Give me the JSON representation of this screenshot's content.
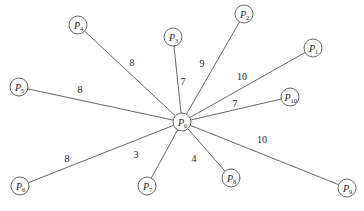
{
  "diagram": {
    "type": "star-graph",
    "center": {
      "id": "P0",
      "letter": "P",
      "sub": "0",
      "x": 182,
      "y": 122
    },
    "node_radius": 9,
    "colors": {
      "stroke": "#555555",
      "text": "#222222",
      "background": "#ffffff"
    },
    "nodes": [
      {
        "id": "P1",
        "letter": "P",
        "sub": "1",
        "x": 313,
        "y": 48,
        "weight": "10",
        "wx": 242,
        "wy": 80
      },
      {
        "id": "P2",
        "letter": "P",
        "sub": "2",
        "x": 244,
        "y": 14,
        "weight": "9",
        "wx": 202,
        "wy": 67
      },
      {
        "id": "P3",
        "letter": "P",
        "sub": "3",
        "x": 173,
        "y": 37,
        "weight": "7",
        "wx": 183,
        "wy": 85
      },
      {
        "id": "P4",
        "letter": "P",
        "sub": "4",
        "x": 78,
        "y": 25,
        "weight": "8",
        "wx": 132,
        "wy": 66
      },
      {
        "id": "P5",
        "letter": "P",
        "sub": "5",
        "x": 19,
        "y": 87,
        "weight": "8",
        "wx": 80,
        "wy": 93
      },
      {
        "id": "P6",
        "letter": "P",
        "sub": "6",
        "x": 20,
        "y": 186,
        "weight": "8",
        "wx": 67,
        "wy": 162
      },
      {
        "id": "P7",
        "letter": "P",
        "sub": "7",
        "x": 147,
        "y": 186,
        "weight": "3",
        "wx": 136,
        "wy": 158
      },
      {
        "id": "P8",
        "letter": "P",
        "sub": "8",
        "x": 231,
        "y": 178,
        "weight": "4",
        "wx": 194,
        "wy": 162
      },
      {
        "id": "P9",
        "letter": "P",
        "sub": "9",
        "x": 347,
        "y": 188,
        "weight": "10",
        "wx": 262,
        "wy": 143
      },
      {
        "id": "P10",
        "letter": "P",
        "sub": "10",
        "x": 290,
        "y": 97,
        "weight": "7",
        "wx": 235,
        "wy": 107
      }
    ]
  }
}
